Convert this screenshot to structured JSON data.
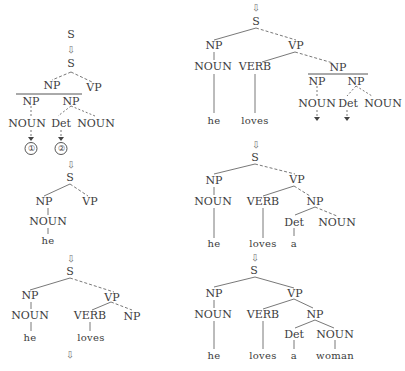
{
  "diagram": {
    "arrow_glyph": "⇩",
    "left_column": {
      "step1": {
        "root": "S",
        "node": "S",
        "children": [
          "NP",
          "VP"
        ],
        "np_split": [
          "NP",
          "NP"
        ],
        "np1_child": "NOUN",
        "np2_children": [
          "Det",
          "NOUN"
        ],
        "markers": [
          "①",
          "②"
        ]
      },
      "step2": {
        "root": "S",
        "np": "NP",
        "vp": "VP",
        "noun": "NOUN",
        "word": "he"
      },
      "step3": {
        "root": "S",
        "np": "NP",
        "vp": "VP",
        "noun": "NOUN",
        "word_he": "he",
        "verb": "VERB",
        "np2": "NP",
        "word_loves": "loves"
      }
    },
    "right_column": {
      "step4": {
        "root": "S",
        "np": "NP",
        "vp": "VP",
        "noun": "NOUN",
        "verb": "VERB",
        "obj_np": "NP",
        "np_split": [
          "NP",
          "NP"
        ],
        "np1_child": "NOUN",
        "np2_children": [
          "Det",
          "NOUN"
        ],
        "word_he": "he",
        "word_loves": "loves"
      },
      "step5": {
        "root": "S",
        "np": "NP",
        "vp": "VP",
        "noun": "NOUN",
        "verb": "VERB",
        "obj_np": "NP",
        "det": "Det",
        "obj_noun": "NOUN",
        "word_he": "he",
        "word_loves": "loves",
        "word_a": "a"
      },
      "step6": {
        "root": "S",
        "np": "NP",
        "vp": "VP",
        "noun": "NOUN",
        "verb": "VERB",
        "obj_np": "NP",
        "det": "Det",
        "obj_noun": "NOUN",
        "word_he": "he",
        "word_loves": "loves",
        "word_a": "a",
        "word_woman": "woman"
      }
    }
  }
}
